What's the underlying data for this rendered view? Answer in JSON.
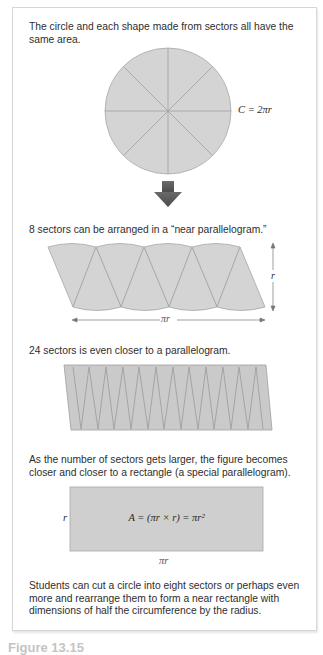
{
  "figure": {
    "intro_text": "The circle and each shape made from sectors all have the same area.",
    "circle": {
      "sectors": 8,
      "label": "C = 2πr",
      "fill_color": "#d4d4d4",
      "line_color": "#9a9a9a"
    },
    "arrow": {
      "icon": "down-arrow-icon",
      "color": "#5a5a5a"
    },
    "eight_sectors": {
      "text": "8 sectors can be arranged in a “near parallelogram.”",
      "height_label": "r",
      "width_label": "πr"
    },
    "twenty_four_sectors": {
      "text": "24 sectors is even closer to a parallelogram."
    },
    "rectangle": {
      "text": "As the number of sectors gets larger, the figure becomes closer and closer to a rectangle (a special parallelogram).",
      "height_label": "r",
      "width_label": "πr",
      "formula": "A = (πr × r) = πr²",
      "fill_color": "#cfcfcf"
    },
    "conclusion_text": "Students can cut a circle into eight sectors or perhaps even more and rearrange them to form a near rectangle with dimensions of half the circumference by the radius.",
    "caption": "Figure 13.15"
  }
}
